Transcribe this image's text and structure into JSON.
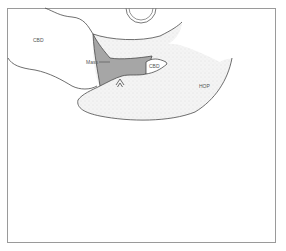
{
  "diagram": {
    "type": "anatomical schematic",
    "labels": {
      "cbd_left": "CBD",
      "mass": "Mass",
      "cbd_right": "CBD",
      "hop": "HOP"
    },
    "colors": {
      "frame": "#9a9a9a",
      "outline": "#4a4a4a",
      "mass_fill": "#a8a8a8",
      "stipple_fill": "#f1f1f1",
      "background": "#ffffff"
    }
  }
}
